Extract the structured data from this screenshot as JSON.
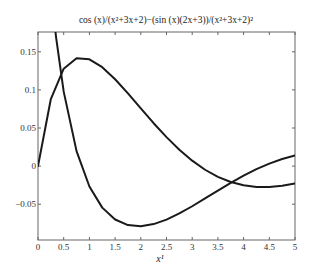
{
  "chart_data": {
    "type": "line",
    "title": "cos (x)/(x²+3x+2)−(sin (x)(2x+3))/(x²+3x+2)²",
    "xlabel": "x¹",
    "ylabel": "",
    "xlim": [
      0,
      5
    ],
    "ylim": [
      -0.097,
      0.176
    ],
    "grid": false,
    "legend": null,
    "x_ticks": [
      0,
      0.5,
      1,
      1.5,
      2,
      2.5,
      3,
      3.5,
      4,
      4.5,
      5
    ],
    "x_tick_labels": [
      "0",
      "0.5",
      "1",
      "1.5",
      "2",
      "2.5",
      "3",
      "3.5",
      "4",
      "4.5",
      "5"
    ],
    "y_ticks": [
      -0.05,
      0,
      0.05,
      0.1,
      0.15
    ],
    "y_tick_labels": [
      "−0.05",
      "0",
      "0.05",
      "0.1",
      "0.15"
    ],
    "series": [
      {
        "name": "sin(x)/(x²+3x+2)",
        "color": "#1a1a1a",
        "x": [
          0,
          0.25,
          0.5,
          0.75,
          1,
          1.25,
          1.5,
          1.75,
          2,
          2.25,
          2.5,
          2.75,
          3,
          3.25,
          3.5,
          3.75,
          4,
          4.25,
          4.5,
          4.75,
          5
        ],
        "values": [
          0,
          0.088,
          0.1278,
          0.1416,
          0.1402,
          0.1298,
          0.114,
          0.0954,
          0.0758,
          0.0563,
          0.038,
          0.0214,
          0.0071,
          -0.0048,
          -0.0142,
          -0.0209,
          -0.0252,
          -0.0273,
          -0.0273,
          -0.0257,
          -0.0228
        ]
      },
      {
        "name": "cos(x)/(x²+3x+2)−(sin(x)(2x+3))/(x²+3x+2)²",
        "color": "#1a1a1a",
        "x": [
          0,
          0.1,
          0.2,
          0.25,
          0.3,
          0.35,
          0.5,
          0.75,
          1,
          1.25,
          1.5,
          1.75,
          2,
          2.25,
          2.5,
          2.75,
          3,
          3.25,
          3.5,
          3.75,
          4,
          4.25,
          4.5,
          4.75,
          5
        ],
        "values": [
          0.5,
          0.3708,
          0.2743,
          0.235,
          0.2005,
          0.17,
          0.0977,
          0.0196,
          -0.0268,
          -0.0545,
          -0.0701,
          -0.0774,
          -0.0789,
          -0.0761,
          -0.0702,
          -0.0621,
          -0.0527,
          -0.0425,
          -0.0321,
          -0.022,
          -0.0125,
          -0.004,
          0.0033,
          0.0093,
          0.0139
        ]
      }
    ]
  }
}
